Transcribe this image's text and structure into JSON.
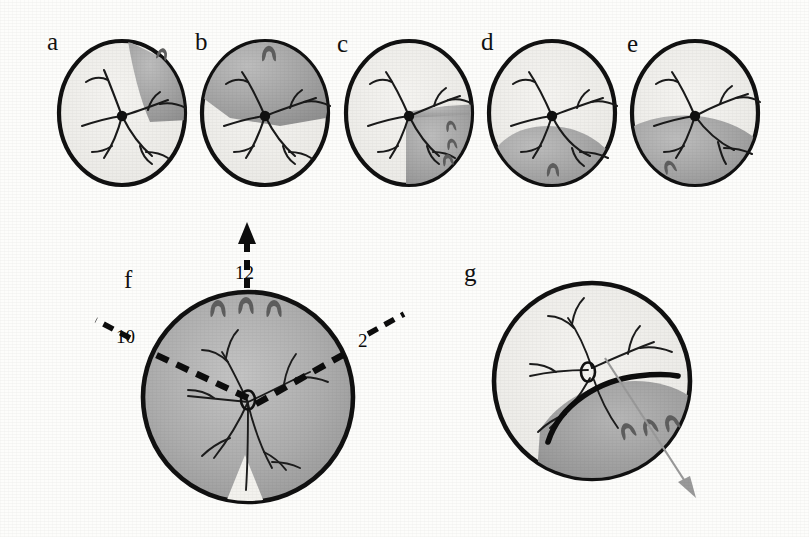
{
  "figure": {
    "type": "medical-illustration",
    "background_color": "#fdfdfb",
    "ink_color": "#111111",
    "shade_color_light": "#f0efec",
    "shade_color_mid": "#a9a9a9",
    "shade_color_dark": "#8c8c8c"
  },
  "panels": [
    {
      "id": "a",
      "label": "a",
      "label_x": 47,
      "label_y": 28,
      "cx": 122,
      "cy": 113,
      "rx": 63,
      "ry": 72,
      "detachment": "small superotemporal wedge",
      "break_count": 1
    },
    {
      "id": "b",
      "label": "b",
      "label_x": 195,
      "label_y": 28,
      "cx": 265,
      "cy": 113,
      "rx": 63,
      "ry": 72,
      "detachment": "superior quadrant extending temporally",
      "break_count": 1
    },
    {
      "id": "c",
      "label": "c",
      "label_x": 337,
      "label_y": 30,
      "cx": 409,
      "cy": 113,
      "rx": 63,
      "ry": 72,
      "detachment": "inferotemporal half",
      "break_count": 3
    },
    {
      "id": "d",
      "label": "d",
      "label_x": 481,
      "label_y": 28,
      "cx": 552,
      "cy": 113,
      "rx": 63,
      "ry": 72,
      "detachment": "inferior bullous detachment",
      "break_count": 1
    },
    {
      "id": "e",
      "label": "e",
      "label_x": 627,
      "label_y": 30,
      "cx": 695,
      "cy": 113,
      "rx": 63,
      "ry": 72,
      "detachment": "inferior detachment crossing macula",
      "break_count": 1
    },
    {
      "id": "f",
      "label": "f",
      "label_x": 124,
      "label_y": 266,
      "cx": 248,
      "cy": 397,
      "rx": 105,
      "ry": 105,
      "detachment": "total detachment sparing inferior wedge",
      "break_count": 3
    },
    {
      "id": "g",
      "label": "g",
      "label_x": 464,
      "label_y": 259,
      "cx": 592,
      "cy": 381,
      "rx": 98,
      "ry": 98,
      "detachment": "inferotemporal detachment with demarcation line",
      "break_count": 3
    }
  ],
  "clock_annotations": [
    {
      "label": "12",
      "x": 235,
      "y": 262,
      "hour": 12
    },
    {
      "label": "10",
      "x": 116,
      "y": 326,
      "hour": 10
    },
    {
      "label": "2",
      "x": 358,
      "y": 330,
      "hour": 2
    }
  ],
  "arrows": [
    {
      "name": "superior-progression-arrow",
      "panel": "f",
      "direction": "up"
    },
    {
      "name": "inferotemporal-progression-arrow",
      "panel": "g",
      "direction": "down-right"
    }
  ],
  "markers": {
    "retinal_break_glyph": "horseshoe-tear",
    "optic_disc_filled": "filled-dot",
    "optic_disc_outline": "open-ellipse"
  }
}
